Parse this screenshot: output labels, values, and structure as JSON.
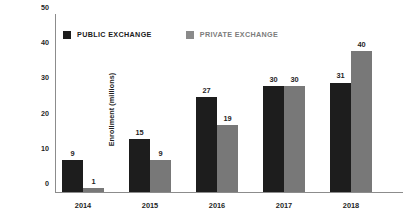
{
  "chart_data": {
    "type": "bar",
    "title": "",
    "xlabel": "",
    "ylabel": "Enrollment (millions)",
    "categories": [
      "2014",
      "2015",
      "2016",
      "2017",
      "2018"
    ],
    "series": [
      {
        "name": "PUBLIC EXCHANGE",
        "color": "#1d1d1d",
        "values": [
          9,
          15,
          27,
          30,
          31
        ]
      },
      {
        "name": "PRIVATE EXCHANGE",
        "color": "#787878",
        "values": [
          1,
          9,
          19,
          30,
          40
        ]
      }
    ],
    "ylim": [
      0,
      50
    ],
    "yticks": [
      0,
      10,
      20,
      30,
      40,
      50
    ],
    "ytick_labels": [
      "0",
      "10",
      "20",
      "30",
      "40",
      "50"
    ],
    "grid": false,
    "legend_position": "top-left",
    "data_labels": true
  },
  "legend": {
    "items": [
      {
        "label": "PUBLIC EXCHANGE",
        "swatch": "legend-swatch-public"
      },
      {
        "label": "PRIVATE EXCHANGE",
        "swatch": "legend-swatch-private"
      }
    ]
  }
}
